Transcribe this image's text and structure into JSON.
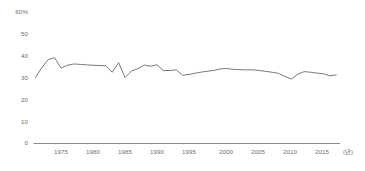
{
  "chart_data": {
    "type": "line",
    "title": "",
    "subtitle": "",
    "xlabel": "(년)",
    "ylabel": "",
    "yunit": "%",
    "ylim": [
      0,
      60
    ],
    "xlim": [
      1971,
      2018
    ],
    "grid": false,
    "legend": null,
    "legend_position": "none",
    "y_ticks": [
      "60%",
      "50",
      "40",
      "30",
      "20",
      "10",
      "0"
    ],
    "y_tick_values": [
      60,
      50,
      40,
      30,
      20,
      10,
      0
    ],
    "x_ticks": [
      "1975",
      "1980",
      "1985",
      "1990",
      "1995",
      "2000",
      "2005",
      "2010",
      "2015"
    ],
    "x_tick_values": [
      1975,
      1980,
      1985,
      1990,
      1995,
      2000,
      2005,
      2010,
      2015
    ],
    "line_color": "#6b6b6b",
    "axis_color": "#808080",
    "label_color": "#6e6e6e",
    "series": [
      {
        "name": "",
        "x": [
          1971,
          1972,
          1973,
          1974,
          1975,
          1976,
          1977,
          1978,
          1979,
          1980,
          1981,
          1982,
          1983,
          1984,
          1985,
          1986,
          1987,
          1988,
          1989,
          1990,
          1991,
          1992,
          1993,
          1994,
          1995,
          1996,
          1997,
          1998,
          1999,
          2000,
          2001,
          2002,
          2003,
          2004,
          2005,
          2006,
          2007,
          2008,
          2009,
          2010,
          2011,
          2012,
          2013,
          2014,
          2015,
          2016,
          2017,
          2018
        ],
        "values": [
          30.0,
          34.5,
          38.2,
          39.1,
          34.3,
          35.6,
          36.2,
          36.0,
          35.8,
          35.6,
          35.5,
          35.4,
          32.4,
          36.8,
          30.0,
          33.0,
          34.0,
          35.7,
          35.2,
          35.8,
          33.2,
          33.2,
          33.5,
          31.0,
          31.4,
          32.0,
          32.5,
          32.9,
          33.3,
          34.0,
          34.1,
          33.7,
          33.6,
          33.5,
          33.5,
          33.2,
          32.8,
          32.4,
          31.9,
          30.5,
          29.3,
          31.5,
          32.7,
          32.4,
          32.0,
          31.7,
          30.8,
          31.2
        ]
      }
    ]
  },
  "axis": {
    "y_unit_suffix": "%",
    "x_unit": "(년)"
  }
}
